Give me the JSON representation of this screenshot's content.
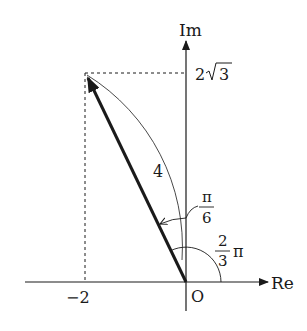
{
  "diagram": {
    "type": "complex-plane",
    "axes": {
      "x_label": "Re",
      "y_label": "Im",
      "origin_label": "O"
    },
    "point": {
      "re": -2,
      "im_label_coef": "2",
      "im_label_radical": "3",
      "re_label": "−2"
    },
    "modulus_label": "4",
    "angle_small": {
      "numerator": "π",
      "denominator": "6"
    },
    "angle_arg": {
      "numerator": "2",
      "denominator": "3",
      "suffix": "π"
    },
    "colors": {
      "ink": "#1a1a1a",
      "background": "#ffffff"
    }
  }
}
